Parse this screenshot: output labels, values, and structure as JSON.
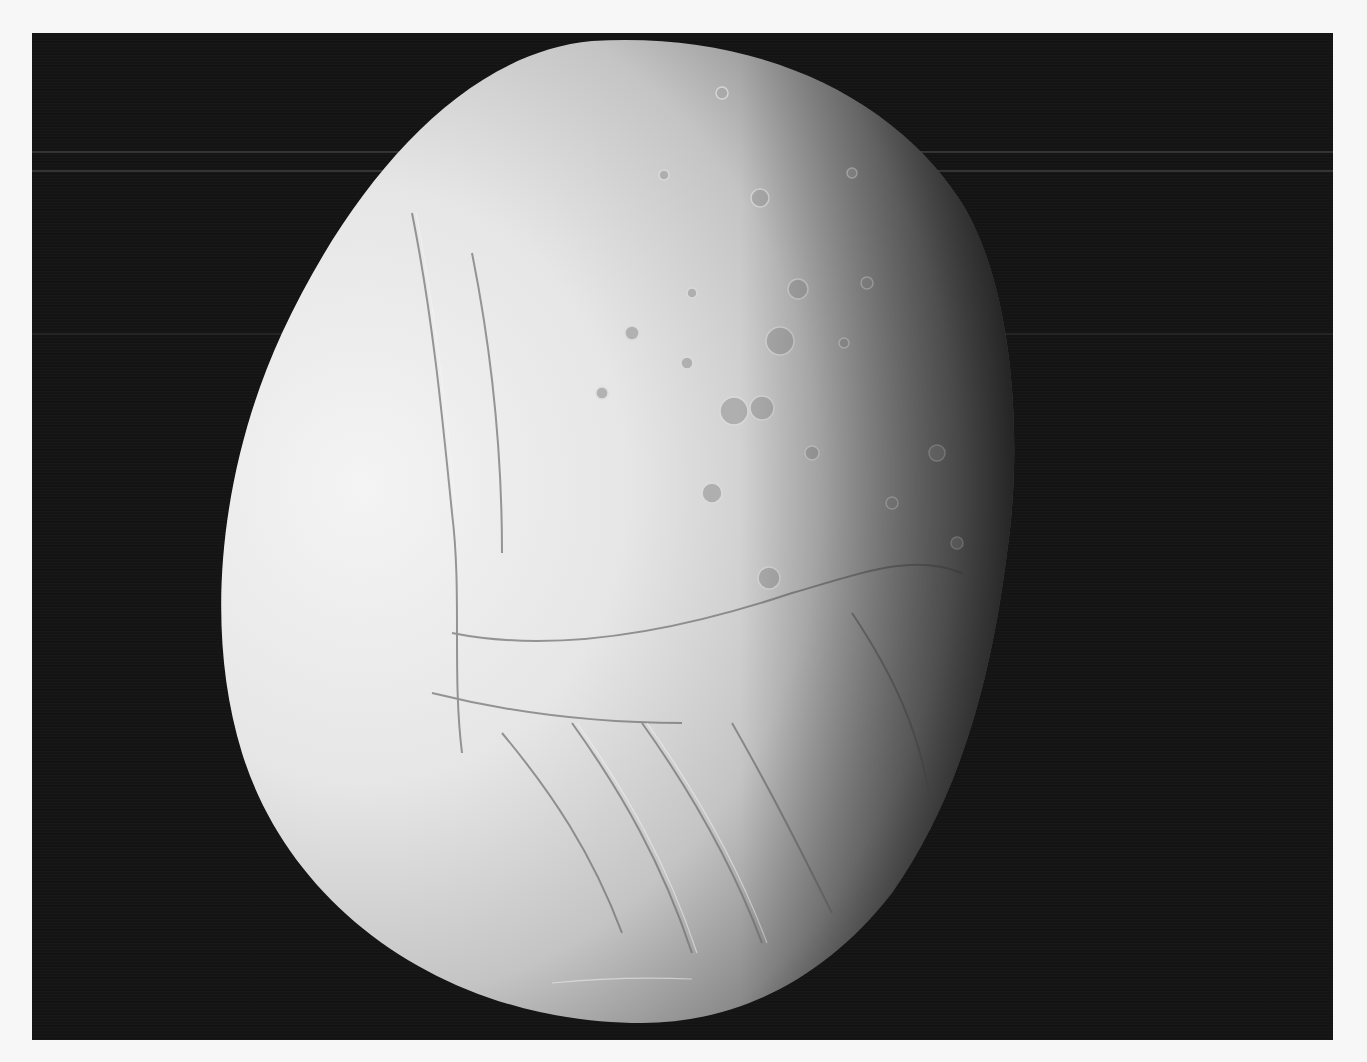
{
  "photo": {
    "subject": "icy moon with cratered northern terrain and tiger-stripe fractures in the south",
    "colors": {
      "border": "#f7f7f7",
      "background": "#141414",
      "surface_light": "#f2f2f2",
      "surface_mid": "#c8c8c8",
      "surface_dark": "#4a4a4a"
    }
  }
}
